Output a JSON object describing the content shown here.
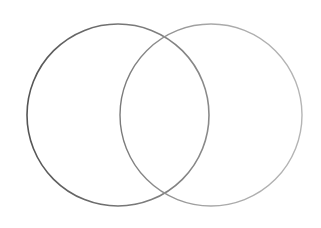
{
  "diagram": {
    "type": "venn",
    "background": "#ffffff",
    "sets": [
      {
        "id": "left",
        "cx": 118,
        "cy": 115,
        "r": 91,
        "stroke": "#6a6a6a",
        "stroke_width": 1.6,
        "fill": "none"
      },
      {
        "id": "right",
        "cx": 211,
        "cy": 115,
        "r": 91,
        "stroke": "#9a9a9a",
        "stroke_width": 1.4,
        "fill": "none"
      }
    ],
    "labels": []
  }
}
